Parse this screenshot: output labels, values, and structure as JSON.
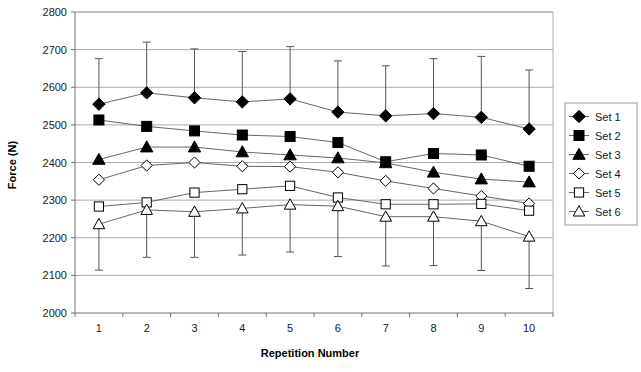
{
  "chart_data": {
    "type": "line",
    "title": "",
    "xlabel": "Repetition Number",
    "ylabel": "Force (N)",
    "x": [
      1,
      2,
      3,
      4,
      5,
      6,
      7,
      8,
      9,
      10
    ],
    "xlim": [
      0.5,
      10.5
    ],
    "ylim": [
      2000,
      2800
    ],
    "yticks": [
      2000,
      2100,
      2200,
      2300,
      2400,
      2500,
      2600,
      2700,
      2800
    ],
    "xticks": [
      "1",
      "2",
      "3",
      "4",
      "5",
      "6",
      "7",
      "8",
      "9",
      "10"
    ],
    "grid": "horizontal",
    "legend_position": "right",
    "series": [
      {
        "name": "Set 1",
        "marker": "filled-diamond",
        "values": [
          2555,
          2585,
          2572,
          2561,
          2569,
          2534,
          2524,
          2530,
          2520,
          2489
        ],
        "error_upper": [
          2676,
          2720,
          2702,
          2695,
          2708,
          2670,
          2657,
          2676,
          2682,
          2646
        ],
        "error_lower": [
          null,
          null,
          null,
          null,
          null,
          null,
          null,
          null,
          null,
          null
        ]
      },
      {
        "name": "Set 2",
        "marker": "filled-square",
        "values": [
          2513,
          2496,
          2484,
          2473,
          2469,
          2453,
          2402,
          2424,
          2420,
          2390
        ],
        "error_upper": [
          null,
          null,
          null,
          null,
          null,
          null,
          null,
          null,
          null,
          null
        ],
        "error_lower": [
          null,
          null,
          null,
          null,
          null,
          null,
          null,
          null,
          null,
          null
        ]
      },
      {
        "name": "Set 3",
        "marker": "filled-triangle",
        "values": [
          2408,
          2441,
          2441,
          2428,
          2420,
          2412,
          2399,
          2374,
          2356,
          2348
        ],
        "error_upper": [
          null,
          null,
          null,
          null,
          null,
          null,
          null,
          null,
          null,
          null
        ],
        "error_lower": [
          null,
          null,
          null,
          null,
          null,
          null,
          null,
          null,
          null,
          null
        ]
      },
      {
        "name": "Set 4",
        "marker": "open-diamond",
        "values": [
          2354,
          2392,
          2400,
          2390,
          2389,
          2374,
          2351,
          2331,
          2311,
          2291
        ],
        "error_upper": [
          null,
          null,
          null,
          null,
          null,
          null,
          null,
          null,
          null,
          null
        ],
        "error_lower": [
          null,
          null,
          null,
          null,
          null,
          null,
          null,
          null,
          null,
          null
        ]
      },
      {
        "name": "Set 5",
        "marker": "open-square",
        "values": [
          2283,
          2294,
          2320,
          2329,
          2338,
          2307,
          2289,
          2289,
          2290,
          2272
        ],
        "error_upper": [
          null,
          null,
          null,
          null,
          null,
          null,
          null,
          null,
          null,
          null
        ],
        "error_lower": [
          null,
          null,
          null,
          null,
          null,
          null,
          null,
          null,
          null,
          null
        ]
      },
      {
        "name": "Set 6",
        "marker": "open-triangle",
        "values": [
          2236,
          2274,
          2269,
          2278,
          2288,
          2284,
          2256,
          2256,
          2244,
          2203
        ],
        "error_upper": [
          null,
          null,
          null,
          null,
          null,
          null,
          null,
          null,
          null,
          null
        ],
        "error_lower": [
          2114,
          2148,
          2148,
          2154,
          2162,
          2150,
          2125,
          2126,
          2113,
          2065
        ]
      }
    ],
    "legend_entries": [
      "Set 1",
      "Set 2",
      "Set 3",
      "Set 4",
      "Set 5",
      "Set 6"
    ],
    "colors": {
      "series": "#000000",
      "grid": "#aaaaaa",
      "axis": "#808080",
      "background": "#ffffff"
    }
  }
}
